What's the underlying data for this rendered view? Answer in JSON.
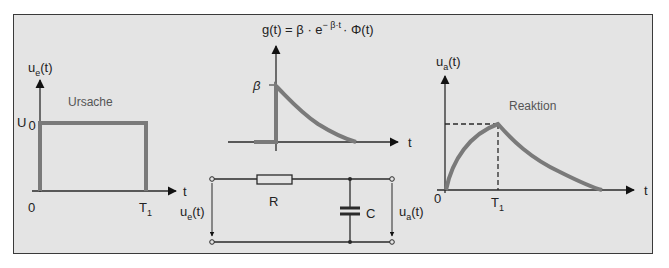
{
  "colors": {
    "background": "#e4e4e4",
    "frame_border": "#3a3a3a",
    "axis": "#2a2a2a",
    "signal": "#7a7a7a",
    "text": "#222222"
  },
  "panel_input": {
    "y_axis_label": "u",
    "y_axis_sub": "e",
    "y_axis_arg": "(t)",
    "x_axis_label": "t",
    "level_label": "U",
    "level_sub": "0",
    "origin": "0",
    "t1_label": "T",
    "t1_sub": "1",
    "caption": "Ursache"
  },
  "panel_impulse": {
    "formula_lhs": "g(t) = β · e",
    "formula_exp": "− β·t",
    "formula_rhs": "· Φ(t)",
    "y_tick_label": "β",
    "x_axis_label": "t"
  },
  "circuit": {
    "resistor_label": "R",
    "capacitor_label": "C",
    "input_voltage": "u",
    "input_sub": "e",
    "input_arg": "(t)",
    "output_voltage": "u",
    "output_sub": "a",
    "output_arg": "(t)"
  },
  "panel_output": {
    "y_axis_label": "u",
    "y_axis_sub": "a",
    "y_axis_arg": "(t)",
    "x_axis_label": "t",
    "origin": "0",
    "t1_label": "T",
    "t1_sub": "1",
    "caption": "Reaktion"
  }
}
